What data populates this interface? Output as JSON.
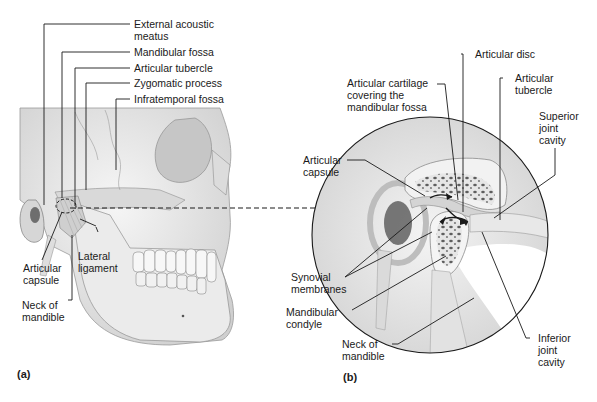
{
  "figure": {
    "panel_a": {
      "tag": "(a)",
      "labels": {
        "external_acoustic_meatus": [
          "External acoustic",
          "meatus"
        ],
        "mandibular_fossa": "Mandibular fossa",
        "articular_tubercle": "Articular tubercle",
        "zygomatic_process": "Zygomatic process",
        "infratemporal_fossa": "Infratemporal fossa",
        "articular_capsule": [
          "Articular",
          "capsule"
        ],
        "lateral_ligament": [
          "Lateral",
          "ligament"
        ],
        "neck_of_mandible": [
          "Neck of",
          "mandible"
        ]
      }
    },
    "panel_b": {
      "tag": "(b)",
      "labels": {
        "articular_disc": "Articular disc",
        "articular_cartilage": [
          "Articular cartilage",
          "covering the",
          "mandibular fossa"
        ],
        "articular_tubercle": [
          "Articular",
          "tubercle"
        ],
        "superior_joint_cavity": [
          "Superior",
          "joint",
          "cavity"
        ],
        "articular_capsule": [
          "Articular",
          "capsule"
        ],
        "synovial_membranes": [
          "Synovial",
          "membranes"
        ],
        "mandibular_condyle": [
          "Mandibular",
          "condyle"
        ],
        "neck_of_mandible": [
          "Neck of",
          "mandible"
        ],
        "inferior_joint_cavity": [
          "Inferior",
          "joint",
          "cavity"
        ]
      }
    },
    "colors": {
      "bone": "#e9e9e9",
      "bone_shade": "#bdbdbd",
      "spongy": "#6b6b6b",
      "line": "#1a1a1a",
      "background_band": "#eeeeee"
    }
  }
}
